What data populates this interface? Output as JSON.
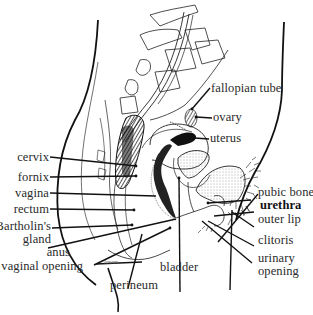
{
  "diagram": {
    "type": "anatomical sagittal section",
    "labels_left": [
      {
        "id": "cervix",
        "text": "cervix"
      },
      {
        "id": "fornix",
        "text": "fornix"
      },
      {
        "id": "vagina",
        "text": "vagina"
      },
      {
        "id": "rectum",
        "text": "rectum"
      },
      {
        "id": "bartholins_gland_1",
        "text": "Bartholin's"
      },
      {
        "id": "bartholins_gland_2",
        "text": "gland"
      },
      {
        "id": "anus",
        "text": "anus"
      },
      {
        "id": "vaginal_opening",
        "text": "vaginal opening"
      }
    ],
    "labels_bottom": [
      {
        "id": "perineum",
        "text": "perineum"
      },
      {
        "id": "bladder",
        "text": "bladder"
      }
    ],
    "labels_right": [
      {
        "id": "fallopian_tube",
        "text": "fallopian tube"
      },
      {
        "id": "ovary",
        "text": "ovary"
      },
      {
        "id": "uterus",
        "text": "uterus"
      },
      {
        "id": "pubic_bone",
        "text": "pubic bone"
      },
      {
        "id": "urethra",
        "text": "urethra"
      },
      {
        "id": "outer_lip",
        "text": "outer lip"
      },
      {
        "id": "clitoris",
        "text": "clitoris"
      },
      {
        "id": "urinary_opening_1",
        "text": "urinary"
      },
      {
        "id": "urinary_opening_2",
        "text": "opening"
      }
    ],
    "inline_annotation": "lower",
    "colors": {
      "ink": "#1a1a1a",
      "label": "#2a2a2a",
      "background": "#ffffff"
    }
  }
}
